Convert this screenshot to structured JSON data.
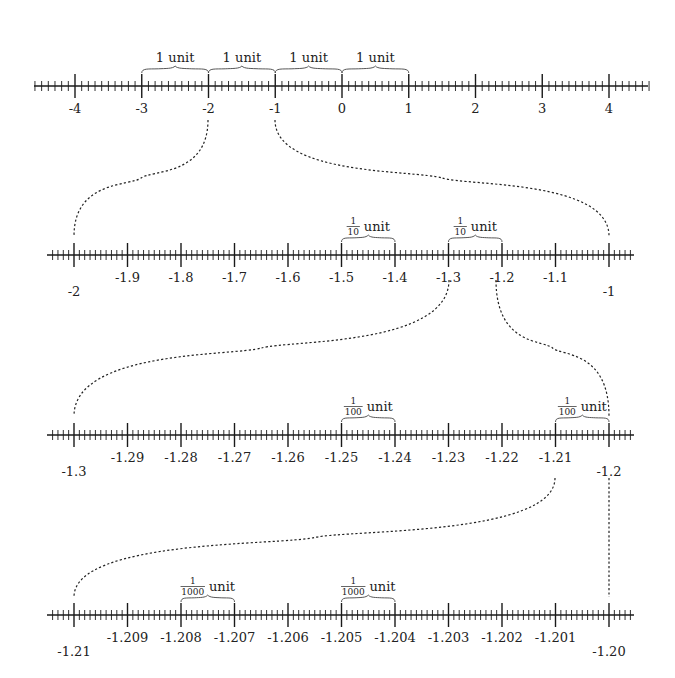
{
  "colors": {
    "ink": "#1a1a1a",
    "brace": "#444444",
    "background": "#ffffff"
  },
  "chart_data": {
    "type": "diagram",
    "lines": [
      {
        "id": "line-1",
        "y": 86,
        "axis_x": [
          34,
          648
        ],
        "range": [
          -4,
          4
        ],
        "major_x": [
          75,
          609
        ],
        "minor_per_major": 10,
        "extend_minor_left": 6,
        "extend_minor_right": 6,
        "labels": [
          "-4",
          "-3",
          "-2",
          "-1",
          "0",
          "1",
          "2",
          "3",
          "4"
        ],
        "label_offsets": [
          0,
          0,
          0,
          0,
          0,
          0,
          0,
          0,
          0
        ],
        "braces": [
          {
            "from_index": 1,
            "to_index": 2,
            "text": "1 unit",
            "fraction": null
          },
          {
            "from_index": 2,
            "to_index": 3,
            "text": "1 unit",
            "fraction": null
          },
          {
            "from_index": 3,
            "to_index": 4,
            "text": "1 unit",
            "fraction": null
          },
          {
            "from_index": 4,
            "to_index": 5,
            "text": "1 unit",
            "fraction": null
          }
        ]
      },
      {
        "id": "line-2",
        "y": 255,
        "axis_x": [
          47,
          634
        ],
        "range": [
          -2,
          -1
        ],
        "major_x": [
          74,
          609
        ],
        "minor_per_major": 10,
        "extend_minor_left": 4,
        "extend_minor_right": 4,
        "labels": [
          "-2",
          "-1.9",
          "-1.8",
          "-1.7",
          "-1.6",
          "-1.5",
          "-1.4",
          "-1.3",
          "-1.2",
          "-1.1",
          "-1"
        ],
        "label_offsets": [
          1,
          0,
          0,
          0,
          0,
          0,
          0,
          0,
          0,
          0,
          1
        ],
        "braces": [
          {
            "from_index": 5,
            "to_index": 6,
            "text": "unit",
            "fraction": {
              "num": "1",
              "den": "10"
            }
          },
          {
            "from_index": 7,
            "to_index": 8,
            "text": "unit",
            "fraction": {
              "num": "1",
              "den": "10"
            }
          }
        ]
      },
      {
        "id": "line-3",
        "y": 435,
        "axis_x": [
          47,
          634
        ],
        "range": [
          -1.3,
          -1.2
        ],
        "major_x": [
          74,
          609
        ],
        "minor_per_major": 10,
        "extend_minor_left": 4,
        "extend_minor_right": 4,
        "labels": [
          "-1.3",
          "-1.29",
          "-1.28",
          "-1.27",
          "-1.26",
          "-1.25",
          "-1.24",
          "-1.23",
          "-1.22",
          "-1.21",
          "-1.2"
        ],
        "label_offsets": [
          1,
          0,
          0,
          0,
          0,
          0,
          0,
          0,
          0,
          0,
          1
        ],
        "braces": [
          {
            "from_index": 5,
            "to_index": 6,
            "text": "unit",
            "fraction": {
              "num": "1",
              "den": "100"
            }
          },
          {
            "from_index": 9,
            "to_index": 10,
            "text": "unit",
            "fraction": {
              "num": "1",
              "den": "100"
            }
          }
        ]
      },
      {
        "id": "line-4",
        "y": 615,
        "axis_x": [
          47,
          634
        ],
        "range": [
          -1.21,
          -1.2
        ],
        "major_x": [
          74,
          609
        ],
        "minor_per_major": 10,
        "extend_minor_left": 4,
        "extend_minor_right": 4,
        "labels": [
          "-1.21",
          "-1.209",
          "-1.208",
          "-1.207",
          "-1.206",
          "-1.205",
          "-1.204",
          "-1.203",
          "-1.202",
          "-1.201",
          "-1.20"
        ],
        "label_offsets": [
          1,
          0,
          0,
          0,
          0,
          0,
          0,
          0,
          0,
          0,
          1
        ],
        "braces": [
          {
            "from_index": 2,
            "to_index": 3,
            "text": "unit",
            "fraction": {
              "num": "1",
              "den": "1000"
            }
          },
          {
            "from_index": 5,
            "to_index": 6,
            "text": "unit",
            "fraction": {
              "num": "1",
              "den": "1000"
            }
          }
        ]
      }
    ],
    "zoom_connectors": [
      {
        "from": {
          "x": 208,
          "y": 120
        },
        "to": {
          "x": 74,
          "y": 236
        },
        "meaning": "-2 maps to left end of line 2"
      },
      {
        "from": {
          "x": 275,
          "y": 120
        },
        "to": {
          "x": 609,
          "y": 236
        },
        "meaning": "-1 maps to right end of line 2"
      },
      {
        "from": {
          "x": 449,
          "y": 280
        },
        "to": {
          "x": 74,
          "y": 416
        },
        "meaning": "-1.3 maps to left end of line 3"
      },
      {
        "from": {
          "x": 496,
          "y": 280
        },
        "to": {
          "x": 609,
          "y": 416
        },
        "meaning": "-1.2 maps to right end of line 3"
      },
      {
        "from": {
          "x": 555,
          "y": 478
        },
        "to": {
          "x": 74,
          "y": 597
        },
        "meaning": "-1.21 maps to left end of line 4"
      },
      {
        "from": {
          "x": 609,
          "y": 478
        },
        "to": {
          "x": 609,
          "y": 597
        },
        "meaning": "-1.2 maps to right end of line 4"
      }
    ]
  }
}
